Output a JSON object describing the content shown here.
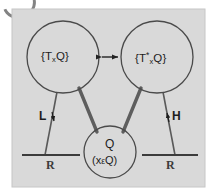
{
  "figure": {
    "panel": {
      "background_color": "#d9d9d9",
      "border_color": "#c3c3c3"
    },
    "stroke_colors": {
      "circle_outline": "#4a4a4a",
      "thick_connector": "#5e5e5e",
      "thin_connector": "#5a5a5a",
      "baseline_bar": "#3c3c3c",
      "double_arrow": "#222222"
    },
    "nodes": [
      {
        "id": "tangent-space",
        "label_prefix": "{T",
        "label_sub": "x",
        "label_sup": "",
        "label_suffix": "Q}",
        "cx": 63,
        "cy": 57,
        "r": 36
      },
      {
        "id": "cotangent-space",
        "label_prefix": "{T",
        "label_sub": "x",
        "label_sup": "*",
        "label_suffix": "Q}",
        "cx": 157,
        "cy": 57,
        "r": 36
      },
      {
        "id": "configuration-space",
        "line1": "Q",
        "line2_open": "(x",
        "line2_member": "ε",
        "line2_close": "Q)",
        "cx": 110,
        "cy": 152,
        "r": 26
      }
    ],
    "connector_labels": {
      "lagrangian": "L",
      "hamiltonian": "H"
    },
    "baselines": [
      {
        "id": "baseline-left",
        "label": "R"
      },
      {
        "id": "baseline-right",
        "label": "R"
      }
    ],
    "double_arrow": {
      "id": "legendre-transform-arrow",
      "label": ""
    }
  }
}
